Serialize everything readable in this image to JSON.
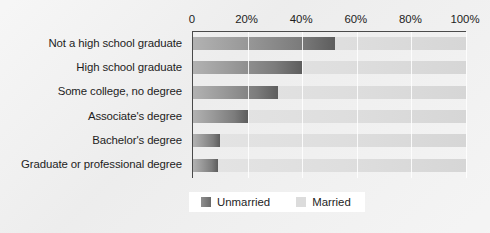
{
  "chart_data": {
    "type": "bar",
    "orientation": "horizontal",
    "stacked": true,
    "title": "",
    "xlabel": "",
    "ylabel": "",
    "xlim": [
      0,
      100
    ],
    "grid": true,
    "legend_position": "bottom",
    "categories": [
      "Not a high school graduate",
      "High school graduate",
      "Some college, no degree",
      "Associate's degree",
      "Bachelor's degree",
      "Graduate or professional degree"
    ],
    "x_tick_labels": [
      "0",
      "20%",
      "40%",
      "60%",
      "80%",
      "100%"
    ],
    "x_tick_values": [
      0,
      20,
      40,
      60,
      80,
      100
    ],
    "series": [
      {
        "name": "Unmarried",
        "color": "#6e6e6e",
        "values": [
          52,
          40,
          31,
          20,
          10,
          9
        ]
      },
      {
        "name": "Married",
        "color": "#dcdcdc",
        "values": [
          48,
          60,
          69,
          80,
          90,
          91
        ]
      }
    ]
  },
  "legend": {
    "items": [
      {
        "label": "Unmarried",
        "swatch": "unmarried"
      },
      {
        "label": "Married",
        "swatch": "married"
      }
    ]
  }
}
